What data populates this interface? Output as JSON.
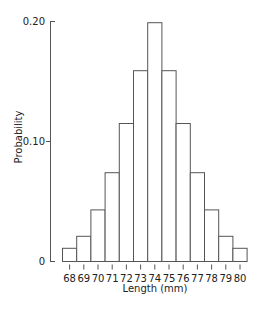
{
  "chart_data": {
    "type": "bar",
    "title": "",
    "xlabel": "Length (mm)",
    "ylabel": "Probability",
    "categories": [
      "68",
      "69",
      "70",
      "71",
      "72",
      "73",
      "74",
      "75",
      "76",
      "77",
      "78",
      "79",
      "80"
    ],
    "values": [
      0.011,
      0.021,
      0.043,
      0.074,
      0.115,
      0.159,
      0.199,
      0.159,
      0.115,
      0.074,
      0.043,
      0.021,
      0.011
    ],
    "ylim": [
      0,
      0.2
    ],
    "yticks": [
      {
        "value": 0,
        "label": "0"
      },
      {
        "value": 0.1,
        "label": "0.10"
      },
      {
        "value": 0.2,
        "label": "0.20"
      }
    ],
    "grid": false,
    "legend": null,
    "bar_style": {
      "fill": "#ffffff",
      "stroke": "#555555"
    }
  }
}
